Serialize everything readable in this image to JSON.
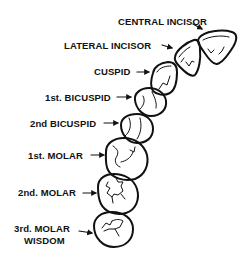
{
  "diagram": {
    "type": "dental-arch-quadrant",
    "teeth": [
      {
        "id": "central-incisor",
        "label": "CENTRAL INCISOR"
      },
      {
        "id": "lateral-incisor",
        "label": "LATERAL INCISOR"
      },
      {
        "id": "cuspid",
        "label": "CUSPID"
      },
      {
        "id": "first-bicuspid",
        "label": "1st. BICUSPID"
      },
      {
        "id": "second-bicuspid",
        "label": "2nd BICUSPID"
      },
      {
        "id": "first-molar",
        "label": "1st. MOLAR"
      },
      {
        "id": "second-molar",
        "label": "2nd. MOLAR"
      },
      {
        "id": "third-molar",
        "label_line1": "3rd. MOLAR",
        "label_line2": "WISDOM"
      }
    ],
    "colors": {
      "stroke": "#111111",
      "background": "#ffffff"
    }
  }
}
